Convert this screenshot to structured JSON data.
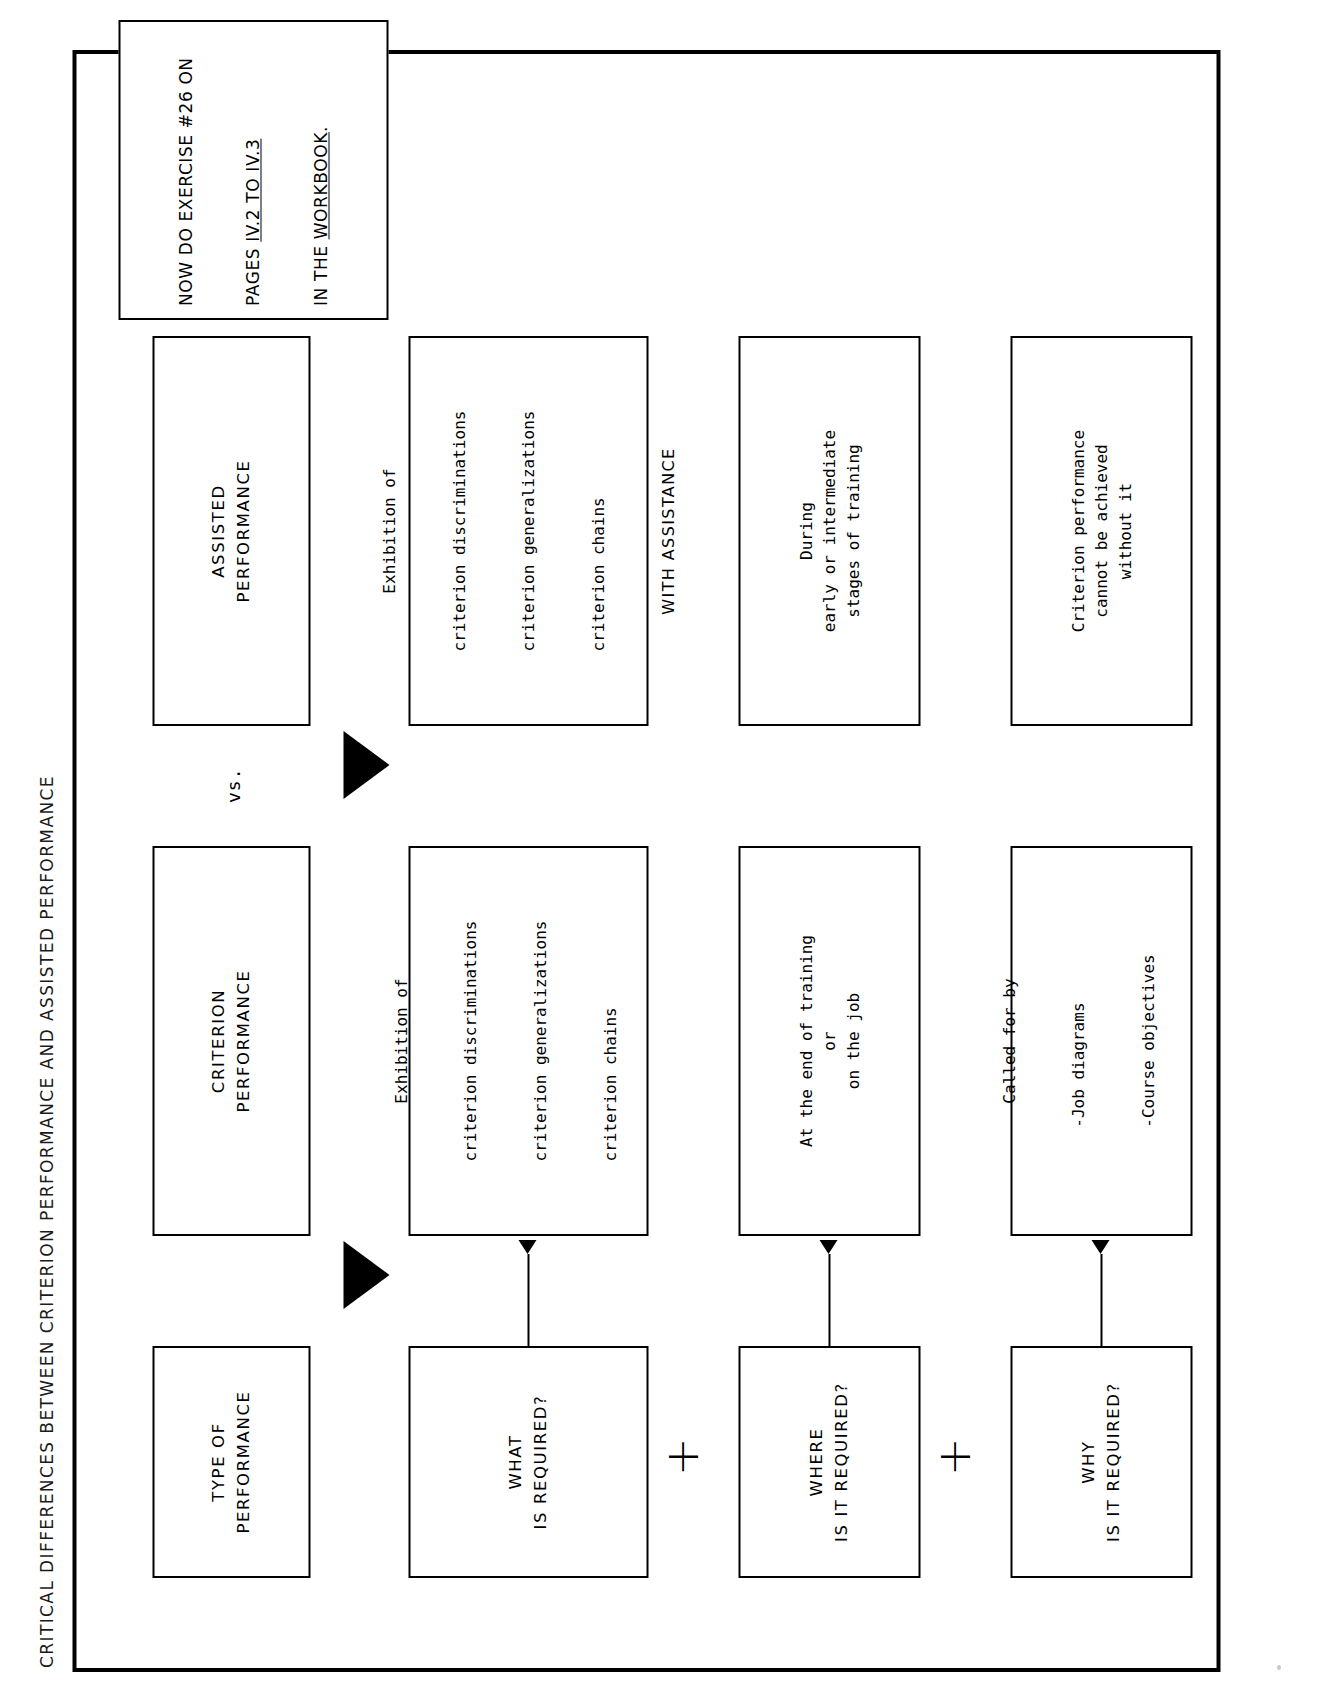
{
  "page": {
    "title": "CRITICAL DIFFERENCES BETWEEN CRITERION PERFORMANCE AND ASSISTED PERFORMANCE"
  },
  "columns": {
    "question_header": {
      "line1": "TYPE OF",
      "line2": "PERFORMANCE"
    },
    "criterion_header": {
      "line1": "CRITERION",
      "line2": "PERFORMANCE"
    },
    "versus_label": "vs.",
    "assisted_header": {
      "line1": "ASSISTED",
      "line2": "PERFORMANCE"
    }
  },
  "rows": [
    {
      "question": {
        "line1": "WHAT",
        "line2": "IS REQUIRED?"
      },
      "criterion": {
        "lead": "Exhibition of",
        "items": [
          "criterion discriminations",
          "criterion generalizations",
          "criterion chains"
        ],
        "footer": ""
      },
      "assisted": {
        "lead": "Exhibition of",
        "items": [
          "criterion discriminations",
          "criterion generalizations",
          "criterion chains"
        ],
        "footer": "WITH ASSISTANCE"
      }
    },
    {
      "question": {
        "line1": "WHERE",
        "line2": "IS IT REQUIRED?"
      },
      "criterion": {
        "lead": "At the end of training",
        "items": [
          "or",
          "on the job"
        ],
        "footer": ""
      },
      "assisted": {
        "lead": "During",
        "items": [
          "early or intermediate",
          "stages of training"
        ],
        "footer": ""
      }
    },
    {
      "question": {
        "line1": "WHY",
        "line2": "IS IT REQUIRED?"
      },
      "criterion": {
        "lead": "Called for by",
        "items": [
          "-Job diagrams",
          "-Course objectives"
        ],
        "footer": ""
      },
      "assisted": {
        "lead": "Criterion performance",
        "items": [
          "cannot be achieved",
          "without it"
        ],
        "footer": ""
      }
    }
  ],
  "connectors": {
    "plus_sign": "+"
  },
  "exercise_note": {
    "line1": "NOW DO EXERCISE #26 ON",
    "line2_pre": "PAGES ",
    "line2_underlined": "IV.2 TO IV.3",
    "line3_pre": "IN THE ",
    "line3_underlined": "WORKBOOK",
    "line3_post": "."
  },
  "colors": {
    "ink": "#000000",
    "paper": "#ffffff"
  }
}
